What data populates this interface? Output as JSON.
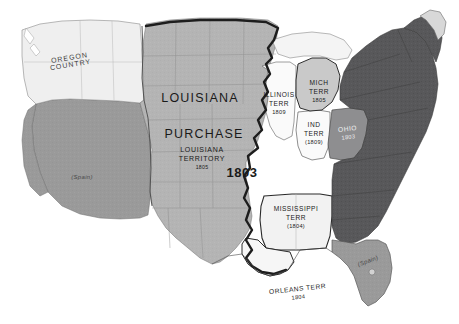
{
  "map": {
    "title": "Louisiana Purchase 1803",
    "style": "grayscale historical map of the United States",
    "colors": {
      "background": "#ffffff",
      "purchase_fill": "#b4b4b4",
      "spanish_fill": "#9a9a9a",
      "original_states_fill": "#58585a",
      "territory_fill": "#f2f2f2",
      "oregon_fill": "#efefef",
      "michigan_fill": "#c9c9c9",
      "border_line": "#6e6e6e",
      "bold_boundary": "#1d1d1d",
      "label_text": "#1a1a1a"
    },
    "regions": [
      {
        "name": "oregon-country",
        "label_lines": [
          "OREGON",
          "COUNTRY"
        ],
        "shade": "white"
      },
      {
        "name": "louisiana-purchase",
        "label_lines": [
          "LOUISIANA",
          "PURCHASE"
        ],
        "sub_lines": [
          "LOUISIANA",
          "TERRITORY",
          "1805"
        ],
        "year": "1803",
        "shade": "medium-gray"
      },
      {
        "name": "spanish-southwest",
        "label": "(Spain)",
        "shade": "gray"
      },
      {
        "name": "spanish-florida",
        "label": "(Spain)",
        "shade": "gray"
      },
      {
        "name": "original-states",
        "label": "",
        "shade": "dark-gray"
      }
    ],
    "labels": {
      "louisiana": "LOUISIANA",
      "purchase": "PURCHASE",
      "louisiana_territory_line1": "LOUISIANA",
      "louisiana_territory_line2": "TERRITORY",
      "louisiana_territory_date": "1805",
      "purchase_year": "1803",
      "oregon_line1": "OREGON",
      "oregon_line2": "COUNTRY",
      "spain_southwest": "(Spain)",
      "spain_florida": "(Spain)"
    },
    "territories": [
      {
        "id": "illinois",
        "line1": "ILLINOIS",
        "line2": "TERR",
        "date": "1809"
      },
      {
        "id": "michigan",
        "line1": "MICH",
        "line2": "TERR",
        "date": "1805"
      },
      {
        "id": "indiana",
        "line1": "IND",
        "line2": "TERR",
        "date": "(1809)"
      },
      {
        "id": "ohio",
        "line1": "OHIO",
        "line2": "",
        "date": "1803"
      },
      {
        "id": "mississippi",
        "line1": "MISSISSIPPI",
        "line2": "TERR",
        "date": "(1804)"
      },
      {
        "id": "orleans",
        "line1": "ORLEANS TERR",
        "line2": "",
        "date": "1804"
      }
    ]
  }
}
